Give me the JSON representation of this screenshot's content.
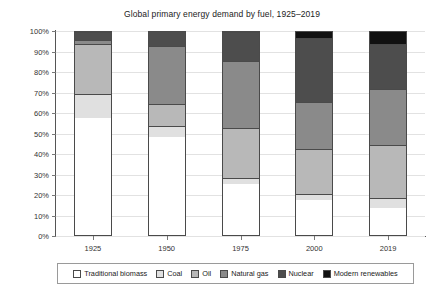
{
  "chart_data": {
    "type": "bar",
    "subtype": "stacked-percentage-column",
    "title": "Global primary energy demand by fuel, 1925–2019",
    "xlabel": "",
    "ylabel": "",
    "categories": [
      "1925",
      "1950",
      "1975",
      "2000",
      "2019"
    ],
    "ylim": [
      0,
      100
    ],
    "ytick_labels": [
      "0%",
      "10%",
      "20%",
      "30%",
      "40%",
      "50%",
      "60%",
      "70%",
      "80%",
      "90%",
      "100%"
    ],
    "ytick_values": [
      0,
      10,
      20,
      30,
      40,
      50,
      60,
      70,
      80,
      90,
      100
    ],
    "grid": true,
    "grid_axis": "y",
    "legend_position": "bottom",
    "series": [
      {
        "name": "Traditional biomass",
        "color": "#ffffff",
        "values": [
          57,
          48,
          25,
          17,
          13
        ]
      },
      {
        "name": "Coal",
        "color": "#e0e0e0",
        "values": [
          12,
          5,
          3,
          3,
          5
        ]
      },
      {
        "name": "Oil",
        "color": "#b8b8b8",
        "values": [
          24,
          11,
          24,
          22,
          26
        ]
      },
      {
        "name": "Natural gas",
        "color": "#8a8a8a",
        "values": [
          2,
          28,
          33,
          23,
          27
        ]
      },
      {
        "name": "Nuclear",
        "color": "#4d4d4d",
        "values": [
          4,
          8,
          14,
          31,
          22
        ]
      },
      {
        "name": "Modern renewables",
        "color": "#111111",
        "values": [
          1,
          0,
          1,
          4,
          7
        ]
      }
    ]
  }
}
